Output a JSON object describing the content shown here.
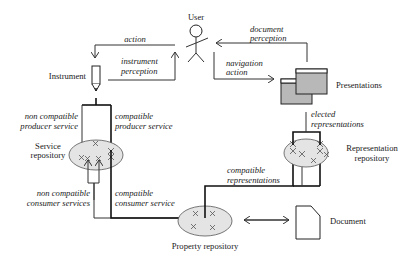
{
  "diagram": {
    "nodes": {
      "user": "User",
      "instrument": "Instrument",
      "presentations": "Presentations",
      "service_repository": [
        "Service",
        "repository"
      ],
      "representation_repository": [
        "Representation",
        "repository"
      ],
      "property_repository": "Property repository",
      "document": "Document"
    },
    "edges": {
      "action": "action",
      "instrument_perception": [
        "instrument",
        "perception"
      ],
      "document_perception": [
        "document",
        "perception"
      ],
      "navigation_action": [
        "navigation",
        "action"
      ],
      "non_compatible_producer": [
        "non compatible",
        "producer service"
      ],
      "compatible_producer": [
        "compatible",
        "producer service"
      ],
      "non_compatible_consumer": [
        "non compatible",
        "consumer services"
      ],
      "compatible_consumer": [
        "compatible",
        "consumer service"
      ],
      "elected_representations": [
        "elected",
        "representations"
      ],
      "compatible_representations": [
        "compatible",
        "representations"
      ]
    },
    "colors": {
      "ellipse_fill": "#e4e4e4",
      "window_fill": "#b8b8b8",
      "line": "#222222"
    }
  }
}
